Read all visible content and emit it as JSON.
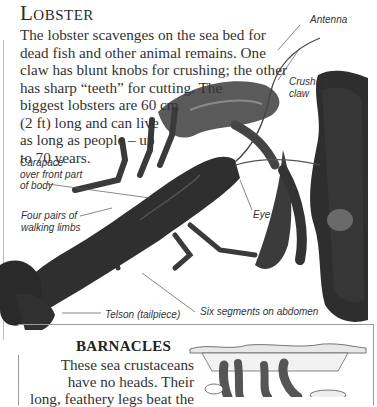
{
  "section": {
    "title": "Lobster",
    "intro_lines": [
      "The lobster scavenges on the sea bed for",
      "dead fish and other animal remains. One",
      "claw has blunt knobs for crushing; the other",
      "has sharp “teeth” for cutting. The",
      "biggest lobsters are 60 cm",
      "(2 ft) long and can live",
      "as long as people – up",
      "to 70 years."
    ]
  },
  "image": {
    "subject": "lobster-photo",
    "labels": {
      "antenna": "Antenna",
      "crushing_claw_1": "Crushing",
      "crushing_claw_2": "claw",
      "carapace_1": "Carapace",
      "carapace_2": "over front part",
      "carapace_3": "of body",
      "limbs_1": "Four pairs of",
      "limbs_2": "walking limbs",
      "eye": "Eye",
      "abdomen": "Six segments on abdomen",
      "telson": "Telson (tailpiece)"
    }
  },
  "barnacles": {
    "title": "BARNACLES",
    "lines": [
      "These sea crustaceans",
      "have no heads. Their",
      "long, feathery legs beat the"
    ],
    "illustration": "barnacles-drawing"
  }
}
